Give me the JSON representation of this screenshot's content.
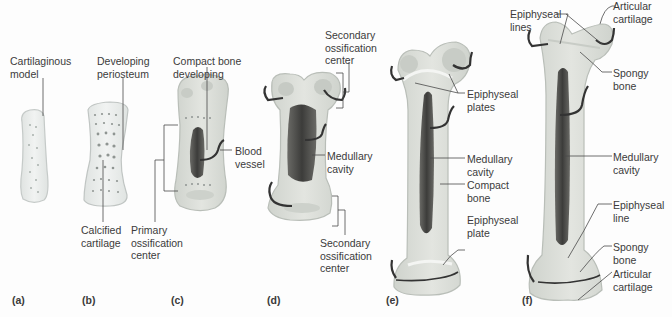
{
  "figure": {
    "panels": [
      {
        "letter": "(a)",
        "labels": {
          "cartilaginous_model": "Cartilaginous\nmodel"
        }
      },
      {
        "letter": "(b)",
        "labels": {
          "developing_periosteum": "Developing\nperiosteum",
          "calcified_cartilage": "Calcified\ncartilage"
        }
      },
      {
        "letter": "(c)",
        "labels": {
          "compact_bone_developing": "Compact bone\ndeveloping",
          "blood_vessel": "Blood\nvessel",
          "primary_ossification_center": "Primary\nossification\ncenter"
        }
      },
      {
        "letter": "(d)",
        "labels": {
          "secondary_ossification_center_top": "Secondary\nossification\ncenter",
          "medullary_cavity": "Medullary\ncavity",
          "secondary_ossification_center_bottom": "Secondary\nossification\ncenter"
        }
      },
      {
        "letter": "(e)",
        "labels": {
          "epiphyseal_plates": "Epiphyseal\nplates",
          "medullary_cavity": "Medullary\ncavity",
          "compact_bone": "Compact\nbone",
          "epiphyseal_plate": "Epiphyseal\nplate"
        }
      },
      {
        "letter": "(f)",
        "labels": {
          "epiphyseal_lines": "Epiphyseal\nlines",
          "articular_cartilage_top": "Articular\ncartilage",
          "spongy_bone_top": "Spongy\nbone",
          "medullary_cavity": "Medullary\ncavity",
          "epiphyseal_line": "Epiphyseal\nline",
          "spongy_bone_bottom": "Spongy\nbone",
          "articular_cartilage_bottom": "Articular\ncartilage"
        }
      }
    ]
  },
  "colors": {
    "background": "#fdfdfd",
    "cartilage": "#e9ecea",
    "cartilage_edge": "#c7cccb",
    "bone": "#d9dcd6",
    "marrow": "#4a4a4a",
    "vessel": "#333333",
    "leader": "#4a4a4a",
    "text": "#3b3b3b"
  }
}
